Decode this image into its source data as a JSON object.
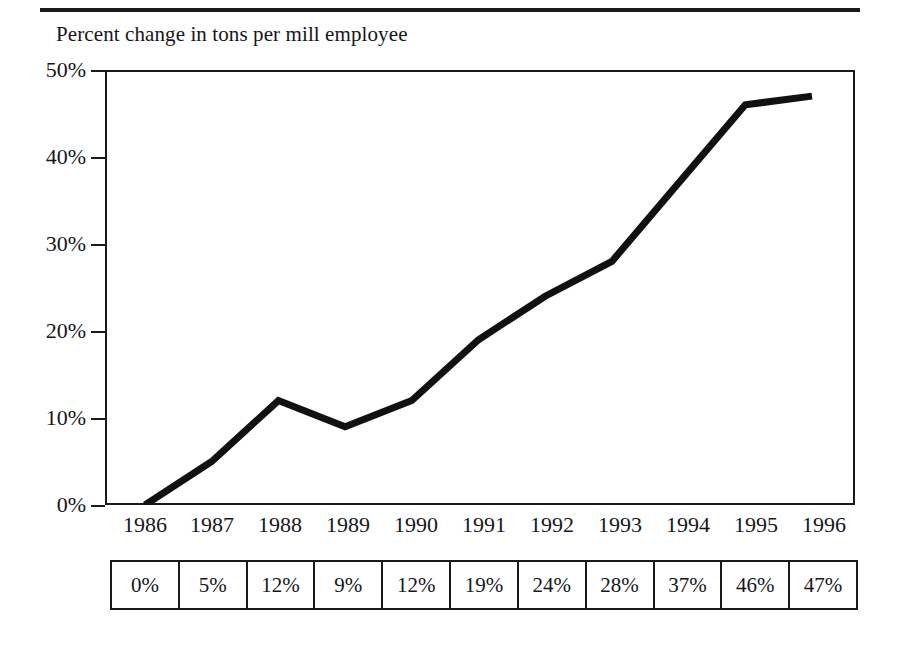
{
  "figure": {
    "title": "Percent change in tons per mill employee",
    "top_rule": true
  },
  "annotations": {
    "right_note": "47 percent increase from 1986",
    "cagr_line1": "Compounded annual",
    "cagr_line2": "growth rate: 3.9 percent"
  },
  "axes": {
    "y_ticks": [
      "50%",
      "40%",
      "30%",
      "20%",
      "10%",
      "0%"
    ],
    "x_ticks": [
      "1986",
      "1987",
      "1988",
      "1989",
      "1990",
      "1991",
      "1992",
      "1993",
      "1994",
      "1995",
      "1996"
    ]
  },
  "table": {
    "cells": [
      "0%",
      "5%",
      "12%",
      "9%",
      "12%",
      "19%",
      "24%",
      "28%",
      "37%",
      "46%",
      "47%"
    ]
  },
  "colors": {
    "ink": "#1a1a1a",
    "series": "#111111",
    "background": "#ffffff"
  },
  "chart_data": {
    "type": "line",
    "title": "Percent change in tons per mill employee",
    "xlabel": "",
    "ylabel": "Percent change in tons per mill employee",
    "x": [
      "1986",
      "1987",
      "1988",
      "1989",
      "1990",
      "1991",
      "1992",
      "1993",
      "1994",
      "1995",
      "1996"
    ],
    "values": [
      0,
      5,
      12,
      9,
      12,
      19,
      24,
      28,
      37,
      46,
      47
    ],
    "series": [
      {
        "name": "Percent change in tons per mill employee",
        "values": [
          0,
          5,
          12,
          9,
          12,
          19,
          24,
          28,
          37,
          46,
          47
        ]
      }
    ],
    "ylim": [
      0,
      50
    ],
    "ytick_values": [
      0,
      10,
      20,
      30,
      40,
      50
    ],
    "ytick_labels": [
      "0%",
      "10%",
      "20%",
      "30%",
      "40%",
      "50%"
    ],
    "grid": false,
    "legend": "none",
    "annotations": [
      "47 percent increase from 1986",
      "Compounded annual growth rate: 3.9 percent"
    ],
    "data_table": {
      "row_labels": [
        "1986",
        "1987",
        "1988",
        "1989",
        "1990",
        "1991",
        "1992",
        "1993",
        "1994",
        "1995",
        "1996"
      ],
      "row_values": [
        "0%",
        "5%",
        "12%",
        "9%",
        "12%",
        "19%",
        "24%",
        "28%",
        "37%",
        "46%",
        "47%"
      ]
    }
  }
}
